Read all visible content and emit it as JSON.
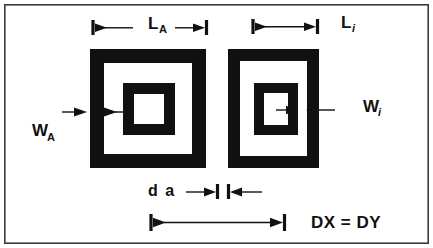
{
  "figure": {
    "type": "technical-line-diagram",
    "background_color": "#ffffff",
    "ink_color": "#111111",
    "border_color": "#3a3a44"
  },
  "labels": {
    "outer_length": {
      "base": "L",
      "sub": "A",
      "sub_style": "upright",
      "full": "L_A"
    },
    "inner_length": {
      "base": "L",
      "sub": "i",
      "sub_style": "italic",
      "full": "L_i"
    },
    "outer_width": {
      "base": "W",
      "sub": "A",
      "sub_style": "upright",
      "full": "W_A"
    },
    "inner_width": {
      "base": "W",
      "sub": "i",
      "sub_style": "italic",
      "full": "W_i"
    },
    "gap": {
      "full": "d a"
    },
    "period": {
      "full": "DX = DY"
    }
  },
  "elements": {
    "left_resonator_name": "left-split-ring-resonator",
    "right_resonator_name": "right-split-ring-resonator",
    "outer_length_dimension_name": "outer-length-dimension",
    "inner_length_dimension_name": "inner-length-dimension",
    "outer_width_dimension_name": "outer-width-dimension",
    "inner_width_dimension_name": "inner-width-dimension",
    "gap_dimension_name": "gap-dimension",
    "period_dimension_name": "period-dimension"
  },
  "geometry": {
    "canvas": {
      "width": 433,
      "height": 248
    },
    "frame": {
      "x": 4,
      "y": 4,
      "width": 425,
      "height": 240
    },
    "left_cell": {
      "outer": {
        "x": 90,
        "y": 49,
        "size": 116,
        "thickness": 14
      },
      "inner": {
        "x": 123,
        "y": 83,
        "size": 52,
        "thickness": 11
      }
    },
    "right_cell": {
      "outer": {
        "x": 228,
        "y": 49,
        "size": 91,
        "thickness": 12
      },
      "inner": {
        "x": 254,
        "y": 83,
        "size": 44,
        "thickness": 10
      }
    },
    "outer_length_dim": {
      "y": 28,
      "x1": 93,
      "x2": 207
    },
    "inner_length_dim": {
      "y": 27,
      "x1": 253,
      "x2": 318
    },
    "outer_width_dim": {
      "y": 112,
      "x1": 62,
      "x2": 112
    },
    "inner_width_dim": {
      "y": 110,
      "x1": 275,
      "x2": 340
    },
    "gap_dim": {
      "y": 190,
      "x1": 178,
      "x2": 240
    },
    "period_dim": {
      "y": 222,
      "x1": 150,
      "x2": 285
    }
  }
}
